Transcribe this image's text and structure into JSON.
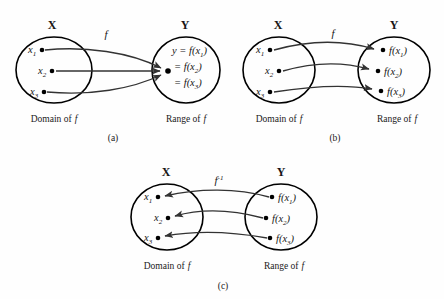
{
  "figure": {
    "background_color": "#fefefe",
    "stroke_color": "#000000",
    "arrow_color": "#333333"
  },
  "panels": [
    {
      "id": "a",
      "caption": "(a)",
      "domain_set_label": "X",
      "range_set_label": "Y",
      "domain_caption_prefix": "Domain of",
      "domain_caption_italic": "f",
      "range_caption_prefix": "Range of",
      "range_caption_italic": "f",
      "map_label": "f",
      "map_label_sup": "",
      "domain_elements": [
        {
          "label": "x",
          "sub": "1"
        },
        {
          "label": "x",
          "sub": "2"
        },
        {
          "label": "x",
          "sub": "3"
        }
      ],
      "range_elements": [
        {
          "line": "y = f(x",
          "sub": "1",
          "close": ")"
        },
        {
          "line": "= f(x",
          "sub": "2",
          "close": ")"
        },
        {
          "line": "= f(x",
          "sub": "3",
          "close": ")"
        }
      ],
      "mapping_kind": "many-to-one",
      "arrow_direction": "domain-to-range"
    },
    {
      "id": "b",
      "caption": "(b)",
      "domain_set_label": "X",
      "range_set_label": "Y",
      "domain_caption_prefix": "Domain of",
      "domain_caption_italic": "f",
      "range_caption_prefix": "Range of",
      "range_caption_italic": "f",
      "map_label": "f",
      "map_label_sup": "",
      "domain_elements": [
        {
          "label": "x",
          "sub": "1"
        },
        {
          "label": "x",
          "sub": "2"
        },
        {
          "label": "x",
          "sub": "3"
        }
      ],
      "range_elements": [
        {
          "line": "f(x",
          "sub": "1",
          "close": ")"
        },
        {
          "line": "f(x",
          "sub": "2",
          "close": ")"
        },
        {
          "line": "f(x",
          "sub": "3",
          "close": ")"
        }
      ],
      "mapping_kind": "one-to-one",
      "arrow_direction": "domain-to-range"
    },
    {
      "id": "c",
      "caption": "(c)",
      "domain_set_label": "X",
      "range_set_label": "Y",
      "domain_caption_prefix": "Domain of",
      "domain_caption_italic": "f",
      "range_caption_prefix": "Range of",
      "range_caption_italic": "f",
      "map_label": "f",
      "map_label_sup": "-1",
      "domain_elements": [
        {
          "label": "x",
          "sub": "1"
        },
        {
          "label": "x",
          "sub": "2"
        },
        {
          "label": "x",
          "sub": "3"
        }
      ],
      "range_elements": [
        {
          "line": "f(x",
          "sub": "1",
          "close": ")"
        },
        {
          "line": "f(x",
          "sub": "2",
          "close": ")"
        },
        {
          "line": "f(x",
          "sub": "3",
          "close": ")"
        }
      ],
      "mapping_kind": "inverse",
      "arrow_direction": "range-to-domain"
    }
  ]
}
